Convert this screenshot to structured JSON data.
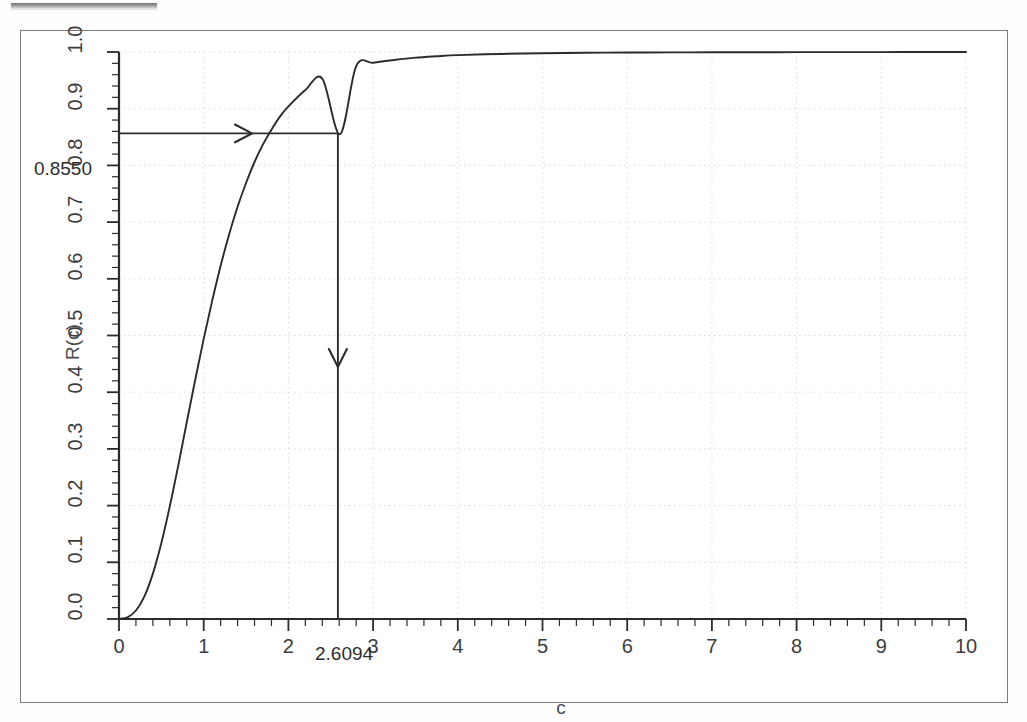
{
  "figure": {
    "background_color": "#ffffff",
    "frame_color": "#7c7c7c",
    "curve_color": "#2b2b2b",
    "grid_color": "#d9d9d9",
    "annotation_color": "#2d2d2d"
  },
  "axes": {
    "ylabel": "R(c)",
    "xlabel": "c"
  },
  "annotations": {
    "y_value_label": "0.8550",
    "x_value_label": "2.6094",
    "horizontal_arrow_name": "arrow-right",
    "vertical_arrow_name": "arrow-down"
  },
  "chart_data": {
    "type": "line",
    "title": "",
    "subtitle": "",
    "xlabel": "c",
    "ylabel": "R(c)",
    "xlim": [
      0,
      10
    ],
    "ylim": [
      0.0,
      1.0
    ],
    "grid": true,
    "legend": "none",
    "xticks": [
      0,
      1,
      2,
      3,
      4,
      5,
      6,
      7,
      8,
      9,
      10
    ],
    "xtick_labels": [
      "0",
      "1",
      "2",
      "3",
      "4",
      "5",
      "6",
      "7",
      "8",
      "9",
      "10"
    ],
    "yticks": [
      0.0,
      0.1,
      0.2,
      0.3,
      0.4,
      0.5,
      0.6,
      0.7,
      0.8,
      0.9,
      1.0
    ],
    "ytick_labels": [
      "0.0",
      "0.1",
      "0.2",
      "0.3",
      "0.4",
      "0.5",
      "0.6",
      "0.7",
      "0.8",
      "0.9",
      "1.0"
    ],
    "minor_ticks": true,
    "series": [
      {
        "name": "R(c)",
        "x": [
          0.0,
          0.1,
          0.2,
          0.3,
          0.4,
          0.5,
          0.6,
          0.7,
          0.8,
          0.9,
          1.0,
          1.1,
          1.2,
          1.3,
          1.4,
          1.5,
          1.6,
          1.7,
          1.8,
          1.9,
          2.0,
          2.2,
          2.4,
          2.6094,
          2.8,
          3.0,
          3.25,
          3.5,
          3.75,
          4.0,
          4.5,
          5.0,
          5.5,
          6.0,
          6.5,
          7.0,
          7.5,
          8.0,
          8.5,
          9.0,
          9.5,
          10.0
        ],
        "y": [
          0.0,
          0.003,
          0.015,
          0.04,
          0.08,
          0.134,
          0.199,
          0.271,
          0.347,
          0.422,
          0.494,
          0.561,
          0.623,
          0.678,
          0.727,
          0.769,
          0.806,
          0.837,
          0.863,
          0.886,
          0.904,
          0.933,
          0.953,
          0.855,
          0.975,
          0.981,
          0.986,
          0.99,
          0.9925,
          0.9945,
          0.9966,
          0.9979,
          0.9986,
          0.999,
          0.9993,
          0.9995,
          0.9996,
          0.9997,
          0.9998,
          0.99985,
          0.9999,
          0.99993
        ]
      }
    ],
    "marked_point": {
      "x": 2.6094,
      "y": 0.855
    }
  }
}
